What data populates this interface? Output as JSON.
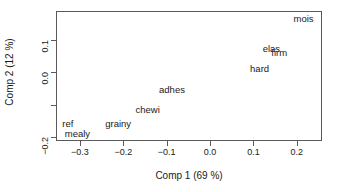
{
  "chart_data": {
    "type": "scatter",
    "title": "",
    "xlabel": "Comp 1 (69 %)",
    "ylabel": "Comp 2 (12 %)",
    "xlim": [
      -0.355,
      0.258
    ],
    "ylim": [
      -0.212,
      0.19
    ],
    "xticks": [
      -0.3,
      -0.2,
      -0.1,
      0.0,
      0.1,
      0.2
    ],
    "xticklabels": [
      "-0.3",
      "-0.2",
      "-0.1",
      "0.0",
      "0.1",
      "0.2"
    ],
    "yticks": [
      0.1,
      0.0,
      -0.1,
      -0.2
    ],
    "yticklabels": [
      "0.1",
      "0.0",
      "",
      "-0.2"
    ],
    "grid": false,
    "legend": null,
    "marker": "text-label-only",
    "points": [
      {
        "label": "mois",
        "x": 0.213,
        "y": 0.168
      },
      {
        "label": "elas",
        "x": 0.139,
        "y": 0.075
      },
      {
        "label": "firm",
        "x": 0.157,
        "y": 0.062
      },
      {
        "label": "hard",
        "x": 0.112,
        "y": 0.014
      },
      {
        "label": "adhes",
        "x": -0.09,
        "y": -0.05
      },
      {
        "label": "chewi",
        "x": -0.146,
        "y": -0.112
      },
      {
        "label": "grainy",
        "x": -0.214,
        "y": -0.157
      },
      {
        "label": "ref",
        "x": -0.33,
        "y": -0.156
      },
      {
        "label": "mealy",
        "x": -0.308,
        "y": -0.187
      }
    ]
  }
}
